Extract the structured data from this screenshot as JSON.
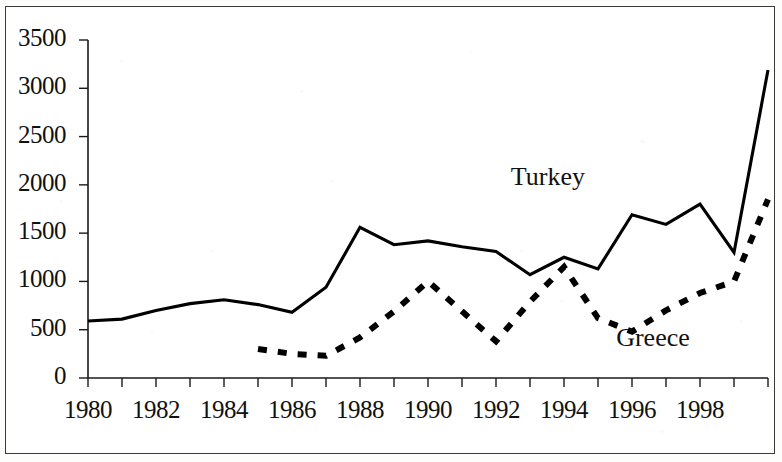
{
  "chart_data": {
    "type": "line",
    "title": "",
    "subtitle": "",
    "xlabel": "",
    "ylabel": "",
    "x": [
      1980,
      1981,
      1982,
      1983,
      1984,
      1985,
      1986,
      1987,
      1988,
      1989,
      1990,
      1991,
      1992,
      1993,
      1994,
      1995,
      1996,
      1997,
      1998,
      1999,
      2000
    ],
    "xlim": [
      1980,
      2000
    ],
    "ylim": [
      0,
      3500
    ],
    "grid": false,
    "legend_position": "inline-annotation",
    "x_tick_labels": [
      "1980",
      "1982",
      "1984",
      "1986",
      "1988",
      "1990",
      "1992",
      "1994",
      "1996",
      "1998"
    ],
    "x_tick_values": [
      1980,
      1982,
      1984,
      1986,
      1988,
      1990,
      1992,
      1994,
      1996,
      1998
    ],
    "x_minor_tick_values": [
      1980,
      1981,
      1982,
      1983,
      1984,
      1985,
      1986,
      1987,
      1988,
      1989,
      1990,
      1991,
      1992,
      1993,
      1994,
      1995,
      1996,
      1997,
      1998,
      1999,
      2000
    ],
    "y_tick_labels": [
      "0",
      "500",
      "1000",
      "1500",
      "2000",
      "2500",
      "3000",
      "3500"
    ],
    "y_tick_values": [
      0,
      500,
      1000,
      1500,
      2000,
      2500,
      3000,
      3500
    ],
    "series": [
      {
        "name": "Turkey",
        "style": "solid",
        "color": "#000000",
        "x": [
          1980,
          1981,
          1982,
          1983,
          1984,
          1985,
          1986,
          1987,
          1988,
          1989,
          1990,
          1991,
          1992,
          1993,
          1994,
          1995,
          1996,
          1997,
          1998,
          1999,
          2000
        ],
        "values": [
          590,
          610,
          700,
          770,
          810,
          760,
          680,
          940,
          1560,
          1380,
          1420,
          1360,
          1310,
          1070,
          1250,
          1130,
          1690,
          1590,
          1800,
          1300,
          3190
        ]
      },
      {
        "name": "Greece",
        "style": "dashed",
        "color": "#000000",
        "x": [
          1985,
          1986,
          1987,
          1988,
          1989,
          1990,
          1991,
          1992,
          1993,
          1994,
          1995,
          1996,
          1997,
          1998,
          1999,
          2000
        ],
        "values": [
          300,
          250,
          230,
          420,
          690,
          1000,
          690,
          380,
          790,
          1150,
          620,
          480,
          700,
          880,
          1000,
          1850
        ]
      }
    ],
    "annotations": [
      {
        "text": "Turkey",
        "x": 1994.2,
        "y": 2050
      },
      {
        "text": "Greece",
        "x": 1997.3,
        "y": 380
      }
    ]
  }
}
